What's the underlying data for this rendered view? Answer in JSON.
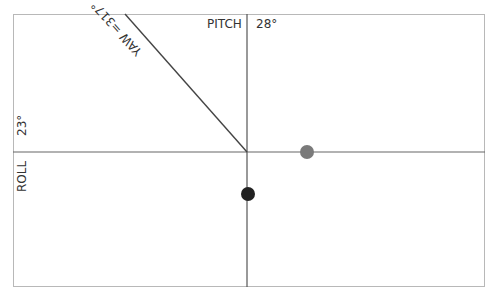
{
  "indicator": {
    "pitch_label": "PITCH",
    "pitch_value": "28°",
    "roll_label": "ROLL",
    "roll_value": "23°",
    "yaw_label": "YAW =317°",
    "colors": {
      "frame": "#b8b8b8",
      "axis": "#555555",
      "yaw_line": "#444444",
      "gray_dot": "#7a7a7a",
      "black_dot": "#222222"
    }
  }
}
